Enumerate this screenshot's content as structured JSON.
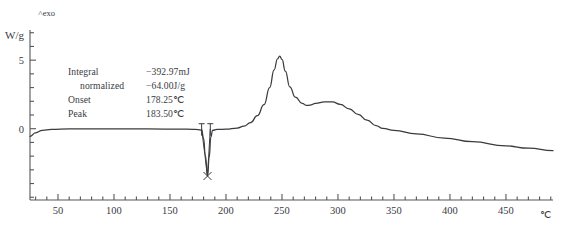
{
  "chart_data": {
    "type": "line",
    "title": "",
    "xlabel": "",
    "ylabel": "W/g",
    "x_unit": "℃",
    "y_unit": "W/g",
    "exo_direction_label": "exo",
    "xlim": [
      25,
      492
    ],
    "ylim": [
      -5.2,
      7.2
    ],
    "grid": false,
    "legend": "none",
    "x_ticks_major": [
      50,
      100,
      150,
      200,
      250,
      300,
      350,
      400,
      450
    ],
    "x_tick_labels": [
      "50",
      "100",
      "150",
      "200",
      "250",
      "300",
      "350",
      "400",
      "450"
    ],
    "x_tick_minor_step": 10,
    "y_ticks_major": [
      0,
      5
    ],
    "y_tick_labels": [
      "0",
      "5"
    ],
    "y_tick_minor_step": 1,
    "series": [
      {
        "name": "heat flow",
        "color": "#3a3b3f",
        "x": [
          25,
          30,
          36,
          44,
          60,
          90,
          130,
          160,
          170,
          175,
          178.25,
          180,
          181.5,
          183.5,
          185,
          186.5,
          188,
          192,
          200,
          210,
          216,
          222,
          228,
          234,
          239,
          243,
          246,
          248,
          250,
          253,
          257,
          262,
          268,
          272,
          275,
          280,
          288,
          295,
          302,
          310,
          318,
          326,
          334,
          340,
          350,
          370,
          395,
          420,
          450,
          470,
          492
        ],
        "y": [
          -0.55,
          -0.3,
          -0.12,
          -0.05,
          -0.02,
          -0.02,
          -0.02,
          -0.03,
          -0.04,
          -0.06,
          -0.1,
          -0.7,
          -1.9,
          -3.45,
          -2.1,
          -0.6,
          -0.12,
          -0.05,
          -0.03,
          0.05,
          0.18,
          0.45,
          0.95,
          1.75,
          3.0,
          4.3,
          5.1,
          5.3,
          5.05,
          4.2,
          3.05,
          2.3,
          1.85,
          1.7,
          1.72,
          1.85,
          1.95,
          1.95,
          1.78,
          1.45,
          1.05,
          0.62,
          0.22,
          0.02,
          -0.12,
          -0.38,
          -0.68,
          -0.95,
          -1.25,
          -1.42,
          -1.6
        ]
      }
    ],
    "annotations": {
      "onset_marker_c": 178.25,
      "peak_marker_c": 186.0,
      "dip_cross_c": 183.5,
      "dip_cross_value": -3.45
    }
  },
  "measurement": {
    "rows": [
      {
        "key": "Integral",
        "value": "−392.97mJ",
        "indent": false
      },
      {
        "key": "normalized",
        "value": "−64.00J/g",
        "indent": true
      },
      {
        "key": "Onset",
        "value": "178.25℃",
        "indent": false
      },
      {
        "key": "Peak",
        "value": "183.50℃",
        "indent": false
      }
    ]
  }
}
